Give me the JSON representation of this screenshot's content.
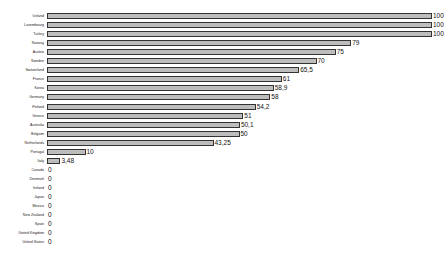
{
  "chart_data": {
    "type": "bar",
    "orientation": "horizontal",
    "title": "",
    "xlabel": "",
    "ylabel": "",
    "xlim": [
      0,
      100
    ],
    "grid": false,
    "legend": null,
    "categories": [
      "Iceland",
      "Luxembourg",
      "Turkey",
      "Norway",
      "Austria",
      "Sweden",
      "Switzerland",
      "France",
      "Korea",
      "Germany",
      "Finland",
      "Greece",
      "Australia",
      "Belgium",
      "Netherlands",
      "Portugal",
      "Italy",
      "Canada",
      "Denmark",
      "Ireland",
      "Japan",
      "Mexico",
      "New Zealand",
      "Spain",
      "United Kingdom",
      "United States"
    ],
    "values": [
      100,
      100,
      100,
      79,
      75,
      70,
      65.5,
      61,
      58.9,
      58,
      54.2,
      51,
      50.1,
      50,
      43.25,
      10,
      3.48,
      0,
      0,
      0,
      0,
      0,
      0,
      0,
      0,
      0
    ],
    "value_labels": [
      "100",
      "100",
      "100",
      "79",
      "75",
      "70",
      "65,5",
      "61",
      "58,9",
      "58",
      "54,2",
      "51",
      "50,1",
      "50",
      "43,25",
      "10",
      "3,48",
      "0",
      "0",
      "0",
      "0",
      "0",
      "0",
      "0",
      "0",
      "0"
    ]
  },
  "colors": {
    "bar_fill": "#bdbdbd",
    "bar_border": "#333333",
    "text": "#111111"
  }
}
